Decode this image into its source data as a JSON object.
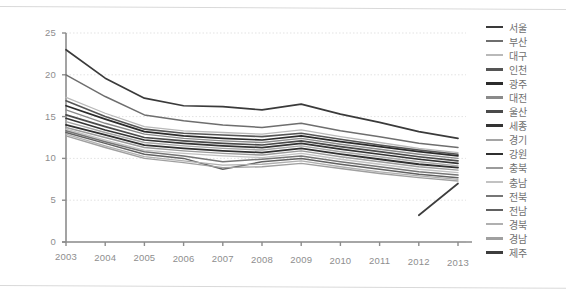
{
  "chart_data": {
    "type": "line",
    "title": "",
    "xlabel": "",
    "ylabel": "",
    "x": [
      2003,
      2004,
      2005,
      2006,
      2007,
      2008,
      2009,
      2010,
      2011,
      2012,
      2013
    ],
    "xticklabels": [
      "2003",
      "2004",
      "2005",
      "2006",
      "2007",
      "2008",
      "2009",
      "2010",
      "2011",
      "2012",
      "2013"
    ],
    "yticklabels": [
      "0",
      "5",
      "10",
      "15",
      "20",
      "25"
    ],
    "yticks": [
      0,
      5,
      10,
      15,
      20,
      25
    ],
    "ylim": [
      0,
      25
    ],
    "xlim": [
      2003,
      2013
    ],
    "grid": true,
    "grid_axis": "y",
    "legend_position": "right",
    "series": [
      {
        "name": "서울",
        "color": "#3a3a3a",
        "width": 1.7,
        "values": [
          23.0,
          19.6,
          17.2,
          16.3,
          16.2,
          15.8,
          16.5,
          15.3,
          14.3,
          13.2,
          12.4
        ]
      },
      {
        "name": "부산",
        "color": "#6e6e6e",
        "width": 1.5,
        "values": [
          20.0,
          17.4,
          15.2,
          14.5,
          14.0,
          13.7,
          14.2,
          13.3,
          12.6,
          11.8,
          11.3
        ]
      },
      {
        "name": "대구",
        "color": "#b9b9b9",
        "width": 1.3,
        "values": [
          17.3,
          15.4,
          13.8,
          13.3,
          13.1,
          12.9,
          13.4,
          12.6,
          11.9,
          11.2,
          10.7
        ]
      },
      {
        "name": "인천",
        "color": "#555555",
        "width": 1.6,
        "values": [
          16.9,
          15.0,
          13.5,
          13.0,
          12.8,
          12.6,
          13.0,
          12.3,
          11.6,
          11.0,
          10.5
        ]
      },
      {
        "name": "광주",
        "color": "#2b2b2b",
        "width": 1.7,
        "values": [
          16.3,
          14.7,
          13.2,
          12.7,
          12.4,
          12.2,
          12.7,
          12.0,
          11.4,
          10.8,
          10.3
        ]
      },
      {
        "name": "대전",
        "color": "#8a8a8a",
        "width": 1.4,
        "values": [
          15.8,
          14.2,
          12.9,
          12.4,
          12.1,
          11.9,
          12.4,
          11.7,
          11.1,
          10.5,
          10.0
        ]
      },
      {
        "name": "울산",
        "color": "#4a4a4a",
        "width": 1.7,
        "values": [
          15.2,
          13.8,
          12.5,
          12.1,
          11.8,
          11.6,
          12.1,
          11.4,
          10.8,
          10.2,
          9.7
        ]
      },
      {
        "name": "세종",
        "color": "#333333",
        "width": 1.7,
        "values": [
          14.8,
          13.4,
          12.2,
          11.8,
          11.5,
          11.3,
          11.8,
          11.1,
          10.5,
          9.9,
          9.4
        ]
      },
      {
        "name": "경기",
        "color": "#a5a5a5",
        "width": 1.4,
        "values": [
          14.4,
          13.1,
          11.9,
          11.5,
          11.2,
          11.0,
          11.5,
          10.8,
          10.2,
          9.6,
          9.1
        ]
      },
      {
        "name": "강원",
        "color": "#2f2f2f",
        "width": 1.8,
        "values": [
          14.0,
          12.8,
          11.6,
          11.2,
          10.9,
          10.7,
          11.2,
          10.5,
          9.9,
          9.3,
          8.9
        ]
      },
      {
        "name": "충북",
        "color": "#9b9b9b",
        "width": 1.4,
        "values": [
          13.7,
          12.5,
          11.3,
          10.9,
          10.6,
          10.4,
          10.9,
          10.2,
          9.6,
          9.0,
          8.6
        ]
      },
      {
        "name": "충남",
        "color": "#c2c2c2",
        "width": 1.3,
        "values": [
          13.5,
          12.2,
          11.0,
          10.6,
          10.3,
          10.1,
          10.6,
          9.9,
          9.3,
          8.7,
          8.3
        ]
      },
      {
        "name": "전북",
        "color": "#767676",
        "width": 1.5,
        "values": [
          13.3,
          12.0,
          10.8,
          10.3,
          9.6,
          9.9,
          10.3,
          9.6,
          9.0,
          8.4,
          8.0
        ]
      },
      {
        "name": "전남",
        "color": "#616161",
        "width": 1.5,
        "values": [
          13.1,
          11.8,
          10.5,
          10.0,
          8.7,
          9.6,
          10.0,
          9.3,
          8.7,
          8.1,
          7.7
        ]
      },
      {
        "name": "경북",
        "color": "#b0b0b0",
        "width": 1.3,
        "values": [
          12.9,
          11.5,
          10.2,
          9.7,
          9.2,
          9.3,
          9.7,
          9.0,
          8.4,
          7.9,
          7.5
        ]
      },
      {
        "name": "경남",
        "color": "#a0a0a0",
        "width": 1.4,
        "values": [
          12.7,
          11.3,
          10.0,
          9.5,
          8.9,
          9.0,
          9.4,
          8.8,
          8.2,
          7.7,
          7.3
        ]
      },
      {
        "name": "제주",
        "color": "#3d3d3d",
        "width": 1.7,
        "values": [
          null,
          null,
          null,
          null,
          null,
          null,
          null,
          null,
          null,
          3.2,
          7.0
        ]
      }
    ]
  }
}
